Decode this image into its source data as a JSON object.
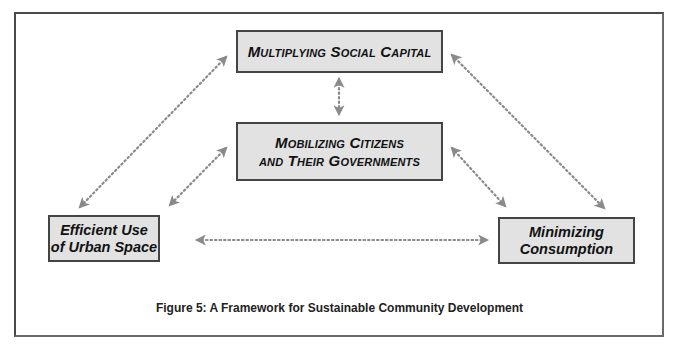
{
  "diagram": {
    "title": "A Framework for Sustainable Community Development",
    "nodes": [
      {
        "id": "social-capital",
        "lines": [
          "Multiplying Social Capital"
        ]
      },
      {
        "id": "mobilizing",
        "lines": [
          "Mobilizing Citizens",
          "and Their Governments"
        ]
      },
      {
        "id": "urban-space",
        "lines": [
          "Efficient Use",
          "of Urban Space"
        ]
      },
      {
        "id": "consumption",
        "lines": [
          "Minimizing",
          "Consumption"
        ]
      }
    ],
    "edges": [
      {
        "from": "social-capital",
        "to": "mobilizing",
        "style": "dotted-bidirectional"
      },
      {
        "from": "social-capital",
        "to": "urban-space",
        "style": "dotted-bidirectional"
      },
      {
        "from": "social-capital",
        "to": "consumption",
        "style": "dotted-bidirectional"
      },
      {
        "from": "mobilizing",
        "to": "urban-space",
        "style": "dotted-bidirectional"
      },
      {
        "from": "mobilizing",
        "to": "consumption",
        "style": "dotted-bidirectional"
      },
      {
        "from": "urban-space",
        "to": "consumption",
        "style": "dotted-bidirectional"
      }
    ]
  },
  "caption": "Figure 5: A Framework for Sustainable Community Development",
  "colors": {
    "box_fill": "#e2e2e2",
    "box_border": "#444444",
    "arrow": "#8a8a8a",
    "frame": "#4a4a4a"
  }
}
